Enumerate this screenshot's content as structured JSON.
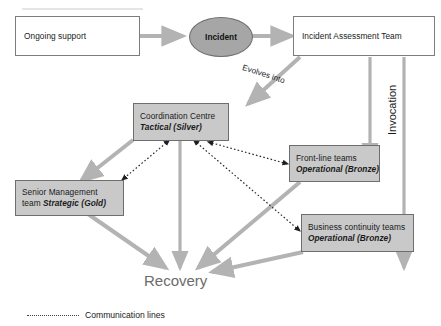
{
  "diagram": {
    "type": "flowchart",
    "nodes": [
      {
        "id": "ongoing-support",
        "label": "Ongoing support",
        "style": "plain-box"
      },
      {
        "id": "incident",
        "label": "Incident",
        "style": "shaded-ellipse"
      },
      {
        "id": "incident-assessment-team",
        "label": "Incident Assessment Team",
        "style": "plain-box"
      },
      {
        "id": "coordination-centre",
        "line1": "Coordination Centre",
        "line2": "Tactical (Silver)",
        "style": "shaded-box"
      },
      {
        "id": "front-line-teams",
        "line1": "Front-line teams",
        "line2": "Operational (Bronze)",
        "style": "shaded-box"
      },
      {
        "id": "senior-management-team",
        "line1": "Senior Management",
        "line2a": "team ",
        "line2": "Strategic (Gold)",
        "style": "shaded-box"
      },
      {
        "id": "business-continuity-teams",
        "line1": "Business continuity teams",
        "line2": "Operational (Bronze)",
        "style": "shaded-box"
      },
      {
        "id": "recovery",
        "label": "Recovery",
        "style": "plain-text"
      }
    ],
    "edge_labels": {
      "evolves_into": "Evolves into",
      "invocation": "Invocation"
    },
    "legend": {
      "communication_lines": "Communication lines"
    },
    "colors": {
      "shaded_fill": "#c9c9c9",
      "ellipse_fill": "#a6a6a6",
      "arrow_gray": "#b3b3b3",
      "box_stroke": "#6e6e6e",
      "dotted_line": "#3d3d3d",
      "recovery_text": "#6b6b6b",
      "background": "#ffffff"
    }
  }
}
